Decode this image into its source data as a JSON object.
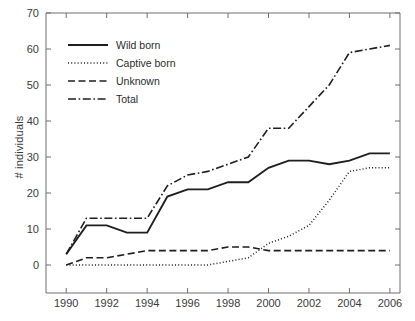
{
  "chart_data": {
    "type": "line",
    "title": "",
    "xlabel": "",
    "ylabel": "# individuals",
    "xlim": [
      1989,
      2006.5
    ],
    "ylim": [
      0,
      70
    ],
    "grid": false,
    "legend_position": "top-left inside plot",
    "x_ticks": [
      "1990",
      "1992",
      "1994",
      "1996",
      "1998",
      "2000",
      "2002",
      "2004",
      "2006"
    ],
    "x_tick_values": [
      1990,
      1992,
      1994,
      1996,
      1998,
      2000,
      2002,
      2004,
      2006
    ],
    "y_ticks": [
      "0",
      "10",
      "20",
      "30",
      "40",
      "50",
      "60",
      "70"
    ],
    "y_tick_values": [
      0,
      10,
      20,
      30,
      40,
      50,
      60,
      70
    ],
    "x": [
      1990,
      1991,
      1992,
      1993,
      1994,
      1995,
      1996,
      1997,
      1998,
      1999,
      2000,
      2001,
      2002,
      2003,
      2004,
      2005,
      2006
    ],
    "series": [
      {
        "name": "Wild born",
        "style": "solid",
        "values": [
          3,
          11,
          11,
          9,
          9,
          19,
          21,
          21,
          23,
          23,
          27,
          29,
          29,
          28,
          29,
          31,
          31
        ]
      },
      {
        "name": "Captive born",
        "style": "dotted",
        "values": [
          0,
          0,
          0,
          0,
          0,
          0,
          0,
          0,
          1,
          2,
          6,
          8,
          11,
          18,
          26,
          27,
          27
        ]
      },
      {
        "name": "Unknown",
        "style": "dashed",
        "values": [
          0,
          2,
          2,
          3,
          4,
          4,
          4,
          4,
          5,
          5,
          4,
          4,
          4,
          4,
          4,
          4,
          4
        ]
      },
      {
        "name": "Total",
        "style": "dash-dot",
        "values": [
          3,
          13,
          13,
          13,
          13,
          22,
          25,
          26,
          28,
          30,
          38,
          38,
          44,
          50,
          59,
          60,
          61
        ]
      }
    ]
  },
  "legend": {
    "entries": [
      {
        "label": "Wild born",
        "style": "solid"
      },
      {
        "label": "Captive born",
        "style": "dotted"
      },
      {
        "label": "Unknown",
        "style": "dashed"
      },
      {
        "label": "Total",
        "style": "dash-dot"
      }
    ]
  },
  "colors": {
    "line": "#1e1e1e",
    "axis": "#6f6f6f",
    "text": "#3a3a3a",
    "background": "#ffffff"
  }
}
